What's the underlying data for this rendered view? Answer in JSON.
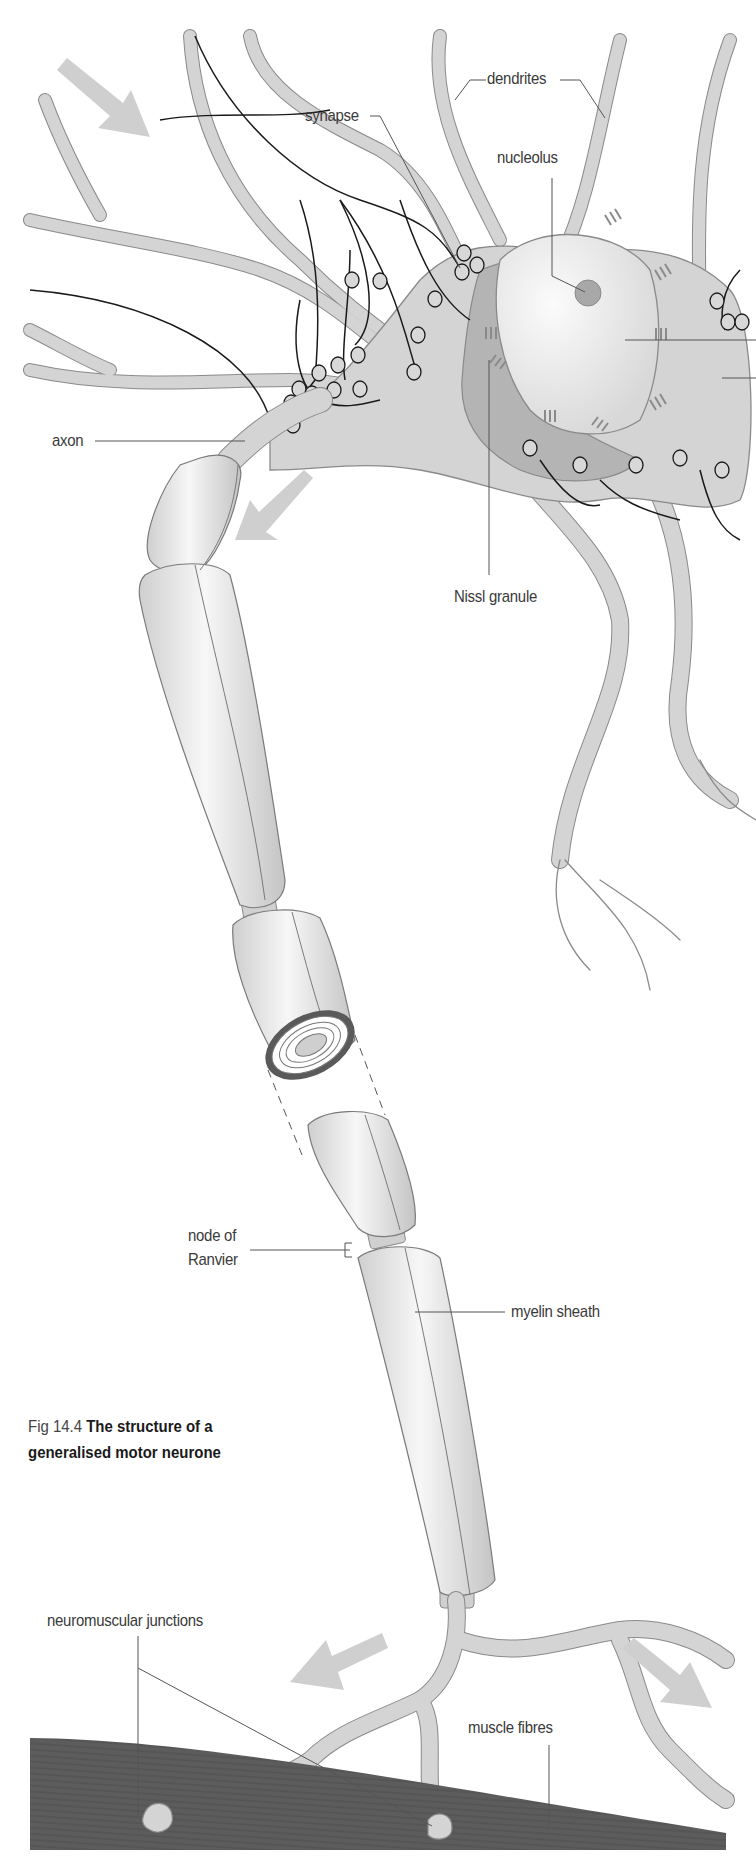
{
  "figure": {
    "number": "Fig 14.4",
    "title_line1": "The structure of a",
    "title_line2": "generalised motor neurone"
  },
  "labels": {
    "dendrites": "dendrites",
    "synapse": "synapse",
    "nucleolus": "nucleolus",
    "axon": "axon",
    "nissl_granule": "Nissl granule",
    "node_of_ranvier_line1": "node of",
    "node_of_ranvier_line2": "Ranvier",
    "myelin_sheath": "myelin sheath",
    "neuromuscular_junctions": "neuromuscular junctions",
    "muscle_fibres": "muscle fibres"
  },
  "arrows": [
    {
      "name": "impulse-in-arrow",
      "direction": "down-right"
    },
    {
      "name": "impulse-axon-arrow",
      "direction": "down-left"
    },
    {
      "name": "impulse-out-left-arrow",
      "direction": "down-left"
    },
    {
      "name": "impulse-out-right-arrow",
      "direction": "down-right"
    }
  ],
  "colors": {
    "tissue": "#d4d4d4",
    "tissue_outline": "#8a8a8a",
    "nucleus": "#ececec",
    "nucleolus": "#a8a8a8",
    "nissl_region": "#b4b4b4",
    "myelin": "#e4e4e4",
    "arrow": "#cfcfcf",
    "muscle": "#5a5a5a",
    "leader": "#555555"
  }
}
